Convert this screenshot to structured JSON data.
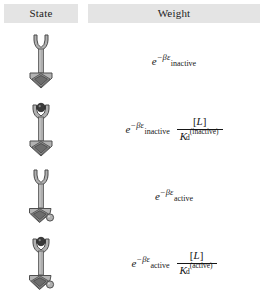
{
  "table": {
    "headers": {
      "state": "State",
      "weight": "Weight"
    },
    "header_band_color": "#e4e4e4",
    "rows": [
      {
        "state_name": "inactive-unbound-receptor",
        "ligand_bound": false,
        "active": false,
        "weight": {
          "expo_base": "e",
          "expo_exponent": "−βε",
          "expo_subscript": "inactive",
          "has_fraction": false,
          "numerator": "",
          "denominator_symbol": "",
          "denominator_sub": "",
          "denominator_sup": ""
        }
      },
      {
        "state_name": "inactive-bound-receptor",
        "ligand_bound": true,
        "active": false,
        "weight": {
          "expo_base": "e",
          "expo_exponent": "−βε",
          "expo_subscript": "inactive",
          "has_fraction": true,
          "numerator": "[L]",
          "numerator_symbol": "L",
          "denominator_symbol": "K",
          "denominator_sub": "d",
          "denominator_sup": "(inactive)"
        }
      },
      {
        "state_name": "active-unbound-receptor",
        "ligand_bound": false,
        "active": true,
        "weight": {
          "expo_base": "e",
          "expo_exponent": "−βε",
          "expo_subscript": "active",
          "has_fraction": false,
          "numerator": "",
          "denominator_symbol": "",
          "denominator_sub": "",
          "denominator_sup": ""
        }
      },
      {
        "state_name": "active-bound-receptor",
        "ligand_bound": true,
        "active": true,
        "weight": {
          "expo_base": "e",
          "expo_exponent": "−βε",
          "expo_subscript": "active",
          "has_fraction": true,
          "numerator": "[L]",
          "numerator_symbol": "L",
          "denominator_symbol": "K",
          "denominator_sub": "d",
          "denominator_sup": "(active)"
        }
      }
    ]
  },
  "icon_colors": {
    "body_light": "#b9b9b9",
    "body_mid": "#9a9a9a",
    "body_dark": "#6f6f6f",
    "outline": "#4a4a4a",
    "ligand": "#3a3a3a",
    "stalk": "#a8a8a8"
  }
}
